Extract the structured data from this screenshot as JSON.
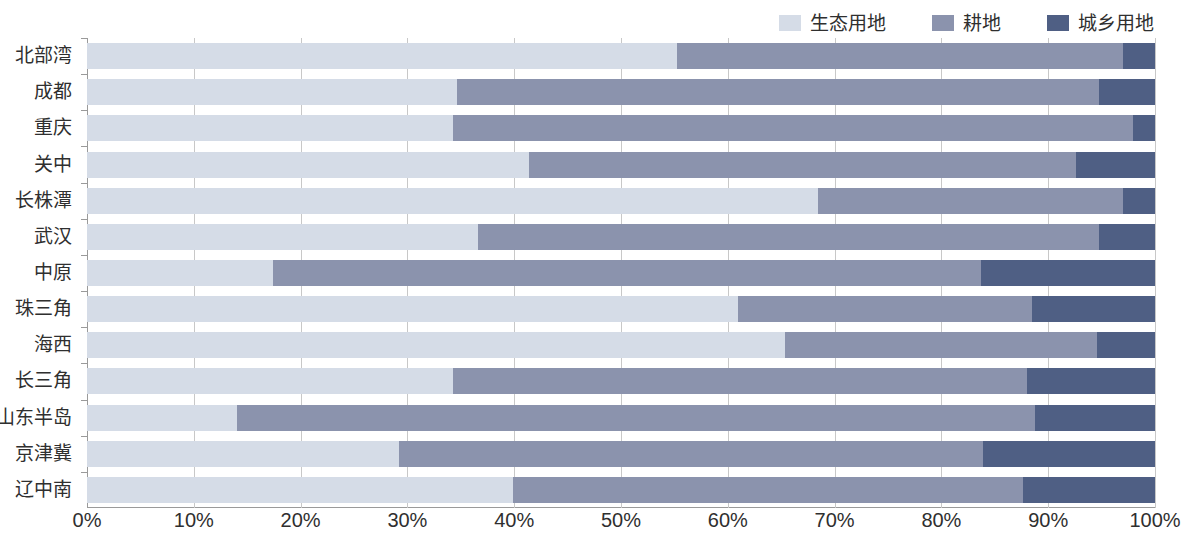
{
  "legend": {
    "position": "top-right",
    "items": [
      {
        "label": "生态用地",
        "color": "#d5dce7"
      },
      {
        "label": "耕地",
        "color": "#8b93ad"
      },
      {
        "label": "城乡用地",
        "color": "#4f5f84"
      }
    ]
  },
  "chart_data": {
    "type": "bar",
    "orientation": "horizontal",
    "stacked": true,
    "stack_mode": "percent",
    "title": "",
    "xlabel": "",
    "ylabel": "",
    "xlim": [
      0,
      100
    ],
    "xticks": [
      0,
      10,
      20,
      30,
      40,
      50,
      60,
      70,
      80,
      90,
      100
    ],
    "xtick_labels": [
      "0%",
      "10%",
      "20%",
      "30%",
      "40%",
      "50%",
      "60%",
      "70%",
      "80%",
      "90%",
      "100%"
    ],
    "grid": "vertical",
    "categories": [
      "北部湾",
      "成都",
      "重庆",
      "关中",
      "长株潭",
      "武汉",
      "中原",
      "珠三角",
      "海西",
      "长三角",
      "山东半岛",
      "京津冀",
      "辽中南"
    ],
    "series": [
      {
        "name": "生态用地",
        "color": "#d5dce7",
        "values": [
          55.2,
          34.6,
          34.3,
          41.4,
          68.4,
          36.6,
          17.4,
          61.0,
          65.4,
          34.3,
          14.0,
          29.2,
          39.9
        ]
      },
      {
        "name": "耕地",
        "color": "#8b93ad",
        "values": [
          41.8,
          60.2,
          63.6,
          51.2,
          28.6,
          58.2,
          66.3,
          27.5,
          29.2,
          53.7,
          74.8,
          54.7,
          47.7
        ]
      },
      {
        "name": "城乡用地",
        "color": "#4f5f84",
        "values": [
          3.0,
          5.2,
          2.1,
          7.4,
          3.0,
          5.2,
          16.3,
          11.5,
          5.4,
          12.0,
          11.2,
          16.1,
          12.4
        ]
      }
    ]
  }
}
